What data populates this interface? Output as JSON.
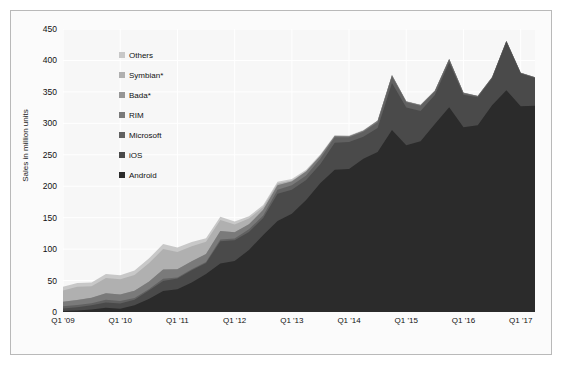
{
  "chart_data": {
    "type": "area",
    "stacked": true,
    "title": "",
    "xlabel": "",
    "ylabel": "Sales in million units",
    "ylim": [
      0,
      450
    ],
    "ytick_step": 50,
    "yticks": [
      0,
      50,
      100,
      150,
      200,
      250,
      300,
      350,
      400,
      450
    ],
    "grid": true,
    "legend_position": "inside-upper-left",
    "x": [
      "Q1 '09",
      "Q2 '09",
      "Q3 '09",
      "Q4 '09",
      "Q1 '10",
      "Q2 '10",
      "Q3 '10",
      "Q4 '10",
      "Q1 '11",
      "Q2 '11",
      "Q3 '11",
      "Q4 '11",
      "Q1 '12",
      "Q2 '12",
      "Q3 '12",
      "Q4 '12",
      "Q1 '13",
      "Q2 '13",
      "Q3 '13",
      "Q4 '13",
      "Q1 '14",
      "Q2 '14",
      "Q3 '14",
      "Q4 '14",
      "Q1 '15",
      "Q2 '15",
      "Q3 '15",
      "Q4 '15",
      "Q1 '16",
      "Q2 '16",
      "Q3 '16",
      "Q4 '16",
      "Q1 '17",
      "Q2 '17"
    ],
    "xtick_labels": [
      "Q1 '09",
      "Q1 '10",
      "Q1 '11",
      "Q1 '12",
      "Q1 '13",
      "Q1 '14",
      "Q1 '15",
      "Q1 '16",
      "Q1 '17"
    ],
    "xtick_indices": [
      0,
      4,
      8,
      12,
      16,
      20,
      24,
      28,
      32
    ],
    "series": [
      {
        "name": "Android",
        "color": "#2b2b2b",
        "values": [
          1.6,
          2.2,
          3.8,
          6.8,
          5.2,
          10.6,
          20.5,
          33.3,
          36.3,
          46.8,
          60.5,
          77.1,
          81.1,
          98.5,
          122.5,
          144.7,
          156.2,
          177.9,
          205.0,
          226.1,
          227.3,
          243.5,
          254.4,
          289.5,
          265.0,
          271.6,
          298.8,
          325.4,
          293.8,
          296.9,
          328.6,
          352.7,
          327.2,
          327.9
        ]
      },
      {
        "name": "iOS",
        "color": "#4a4a4a",
        "values": [
          3.8,
          5.3,
          7.0,
          8.5,
          8.4,
          8.7,
          13.5,
          16.0,
          16.9,
          19.6,
          17.3,
          35.5,
          33.1,
          28.9,
          26.9,
          43.5,
          38.3,
          31.9,
          30.3,
          43.1,
          43.1,
          35.2,
          38.2,
          74.8,
          60.2,
          48.1,
          46.1,
          71.5,
          51.6,
          44.4,
          43.0,
          77.0,
          51.9,
          44.3
        ]
      },
      {
        "name": "Microsoft",
        "color": "#616161",
        "values": [
          3.8,
          3.8,
          3.3,
          4.2,
          3.7,
          3.1,
          2.2,
          3.4,
          1.6,
          1.7,
          1.7,
          2.8,
          2.7,
          4.1,
          4.1,
          6.2,
          7.0,
          7.4,
          8.9,
          8.8,
          7.6,
          8.1,
          9.0,
          10.4,
          8.3,
          8.2,
          5.9,
          4.4,
          2.4,
          1.9,
          1.1,
          1.1,
          1.0,
          0.8
        ]
      },
      {
        "name": "RIM",
        "color": "#7a7a7a",
        "values": [
          7.2,
          7.8,
          8.5,
          10.5,
          10.6,
          11.2,
          11.9,
          14.7,
          13.0,
          12.7,
          12.7,
          13.2,
          9.9,
          7.9,
          8.9,
          7.3,
          6.2,
          6.2,
          4.4,
          1.7,
          1.3,
          1.5,
          2.4,
          1.7,
          1.3,
          1.1,
          0.9,
          0.9,
          0.7,
          0.4,
          0.4,
          0.2,
          0.2,
          0.1
        ]
      },
      {
        "name": "Bada*",
        "color": "#969696"
      },
      {
        "name": "Symbian*",
        "color": "#b0b0b0",
        "values": [
          17.8,
          20.9,
          18.3,
          23.9,
          24.1,
          25.4,
          29.5,
          32.6,
          27.6,
          23.9,
          19.5,
          17.5,
          12.5,
          9.1,
          4.4,
          2.6,
          1.3,
          0.7,
          0.5,
          0.3,
          0.2,
          0.1,
          0.1,
          0.1,
          0.0,
          0.0,
          0.0,
          0.0,
          0.0,
          0.0,
          0.0,
          0.0,
          0.0,
          0.0
        ]
      },
      {
        "name": "Others",
        "color": "#c8c8c8",
        "values": [
          5.8,
          6.1,
          5.9,
          6.6,
          6.5,
          6.8,
          7.3,
          8.0,
          7.0,
          6.5,
          5.7,
          5.4,
          4.5,
          3.8,
          3.3,
          2.8,
          2.3,
          2.0,
          1.7,
          1.4,
          1.2,
          1.1,
          1.0,
          0.9,
          0.8,
          0.7,
          0.6,
          0.6,
          0.5,
          0.4,
          0.4,
          0.3,
          0.3,
          0.2
        ]
      }
    ],
    "legend_entries": [
      {
        "label": "Others",
        "color": "#c8c8c8"
      },
      {
        "label": "Symbian*",
        "color": "#b0b0b0"
      },
      {
        "label": "Bada*",
        "color": "#969696"
      },
      {
        "label": "RIM",
        "color": "#7a7a7a"
      },
      {
        "label": "Microsoft",
        "color": "#616161"
      },
      {
        "label": "iOS",
        "color": "#4a4a4a"
      },
      {
        "label": "Android",
        "color": "#2b2b2b"
      }
    ],
    "totals": [
      40,
      46,
      47,
      60,
      58,
      66,
      85,
      108,
      102,
      111,
      117,
      152,
      144,
      152,
      170,
      207,
      211,
      226,
      251,
      281,
      281,
      290,
      305,
      368,
      336,
      330,
      352,
      403,
      349,
      344,
      374,
      432,
      381,
      368
    ]
  }
}
